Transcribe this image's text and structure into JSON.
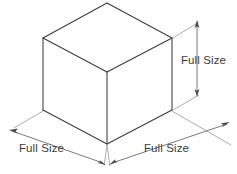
{
  "figure": {
    "type": "isometric-cube-dimension-diagram",
    "background_color": "#ffffff",
    "line_color": "#3c3c3c",
    "dimension_line_color": "#6b6b6b",
    "text_color": "#3c3c3c"
  },
  "labels": {
    "height": "Full Size",
    "width_left": "Full Size",
    "width_right": "Full Size"
  },
  "geometry": {
    "cube": {
      "top_vertex": [
        107,
        3
      ],
      "left_top_vertex": [
        43,
        38
      ],
      "right_top_vertex": [
        172,
        38
      ],
      "front_top_vertex": [
        107,
        72
      ],
      "left_bottom_vertex": [
        43,
        110
      ],
      "right_bottom_vertex": [
        172,
        110
      ],
      "front_bottom_vertex": [
        107,
        144
      ]
    }
  }
}
